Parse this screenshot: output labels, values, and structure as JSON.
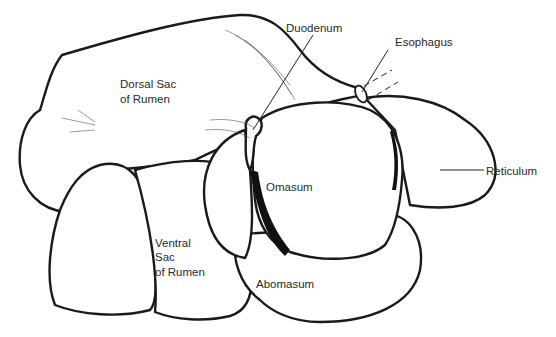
{
  "diagram": {
    "labels": {
      "duodenum": "Duodenum",
      "esophagus": "Esophagus",
      "dorsal_sac_line1": "Dorsal Sac",
      "dorsal_sac_line2": "of Rumen",
      "reticulum": "Reticulum",
      "omasum": "Omasum",
      "ventral_sac_line1": "Ventral",
      "ventral_sac_line2": "Sac",
      "ventral_sac_line3": "of Rumen",
      "abomasum": "Abomasum"
    }
  }
}
